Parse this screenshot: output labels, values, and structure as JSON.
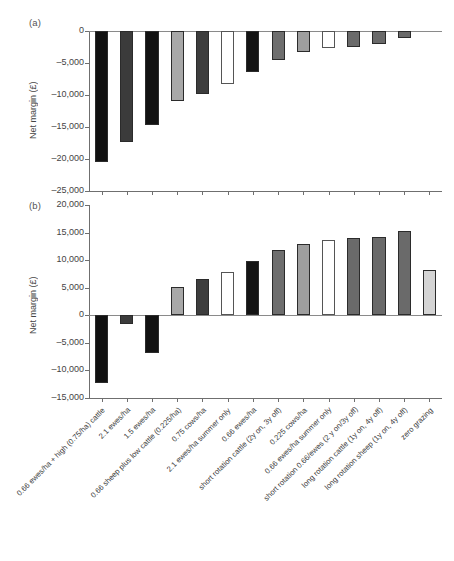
{
  "figure": {
    "caption": "",
    "panel_a_label": "(a)",
    "panel_b_label": "(b)",
    "y_axis_title": "Net margin (£)"
  },
  "chart_data": [
    {
      "type": "bar",
      "panel": "(a)",
      "title": "",
      "xlabel": "",
      "ylabel": "Net margin (£)",
      "ylim": [
        -25000,
        0
      ],
      "yticks": [
        0,
        -5000,
        -10000,
        -15000,
        -20000,
        -25000
      ],
      "ytick_labels": [
        "0",
        "–5,000",
        "–10,000",
        "–15,000",
        "–20,000",
        "–25,000"
      ],
      "grid": false,
      "legend": "none",
      "categories": [
        "0.66 ewes/ha + high (0.75/ha) cattle",
        "2.1 ewes/ha",
        "1.5 ewes/ha",
        "0.66 sheep plus low cattle (0.225/ha)",
        "0.75 cows/ha",
        "2.1 ewes/ha summer only",
        "0.66 ewes/ha",
        "short rotation cattle (2y on, 3y off)",
        "0.225 cows/ha",
        "0.66 ewes/ha summer only",
        "short rotation 0.66/ewes (2 y on/3y off)",
        "long rotation cattle (1y on, 4y off)",
        "long rotation sheep (1y on, 4y off)",
        "zero grazing"
      ],
      "values": [
        -20400,
        -17300,
        -14700,
        -11000,
        -9800,
        -8300,
        -6400,
        -4500,
        -3300,
        -2700,
        -2500,
        -2000,
        -1100,
        0
      ],
      "bar_colors": [
        "#111111",
        "#3b3b3b",
        "#121212",
        "#a8a8a8",
        "#3d3d3d",
        "#ffffff",
        "#141414",
        "#6e6e6e",
        "#9e9e9e",
        "#ffffff",
        "#6a6a6a",
        "#6a6a6a",
        "#6a6a6a",
        "#ffffff"
      ]
    },
    {
      "type": "bar",
      "panel": "(b)",
      "title": "",
      "xlabel": "",
      "ylabel": "Net margin (£)",
      "ylim": [
        -15000,
        20000
      ],
      "yticks": [
        20000,
        15000,
        10000,
        5000,
        0,
        -5000,
        -10000,
        -15000
      ],
      "ytick_labels": [
        "20,000",
        "15,000",
        "10,000",
        "5,000",
        "0",
        "–5,000",
        "–10,000",
        "–15,000"
      ],
      "grid": false,
      "legend": "none",
      "categories": [
        "0.66 ewes/ha + high (0.75/ha) cattle",
        "2.1 ewes/ha",
        "1.5 ewes/ha",
        "0.66 sheep plus low cattle (0.225/ha)",
        "0.75 cows/ha",
        "2.1 ewes/ha summer only",
        "0.66 ewes/ha",
        "short rotation cattle (2y on, 3y off)",
        "0.225 cows/ha",
        "0.66 ewes/ha summer only",
        "short rotation 0.66/ewes (2 y on/3y off)",
        "long rotation cattle (1y on, 4y off)",
        "long rotation sheep (1y on, 4y off)",
        "zero grazing"
      ],
      "values": [
        -12300,
        -1500,
        -6800,
        5200,
        6600,
        7800,
        9800,
        11900,
        13000,
        13700,
        14000,
        14200,
        15200,
        8200
      ],
      "bar_colors": [
        "#111111",
        "#3b3b3b",
        "#121212",
        "#a8a8a8",
        "#3d3d3d",
        "#ffffff",
        "#141414",
        "#6e6e6e",
        "#9e9e9e",
        "#ffffff",
        "#6a6a6a",
        "#6a6a6a",
        "#6a6a6a",
        "#d4d4d4"
      ]
    }
  ]
}
